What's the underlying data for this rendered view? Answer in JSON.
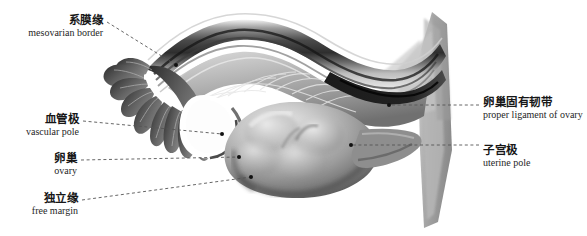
{
  "figure": {
    "width": 587,
    "height": 236,
    "background_color": "#ffffff",
    "style": "grayscale medical illustration"
  },
  "colors": {
    "label_text": "#171717",
    "english_text": "#262626",
    "leader_line": "#555555",
    "marker_dot": "#111111",
    "tissue_dark": "#3a3a3a",
    "tissue_mid": "#8a8a8a",
    "tissue_light": "#d2d2d2",
    "ovary_body": "#9a9a9a",
    "uterine_horn": "#a8a8a8"
  },
  "labels": [
    {
      "id": "mesovarian-border",
      "cn": "系膜缘",
      "en": "mesovarian border",
      "side": "left",
      "text_x": 103,
      "text_y": 14,
      "line_start_x": 107,
      "line_start_y": 22,
      "point_x": 176,
      "point_y": 65
    },
    {
      "id": "vascular-pole",
      "cn": "血管极",
      "en": "vascular pole",
      "side": "left",
      "text_x": 79,
      "text_y": 113,
      "line_start_x": 83,
      "line_start_y": 121,
      "point_x": 222,
      "point_y": 134
    },
    {
      "id": "ovary",
      "cn": "卵巢",
      "en": "ovary",
      "side": "left",
      "text_x": 77,
      "text_y": 152,
      "line_start_x": 81,
      "line_start_y": 160,
      "point_x": 239,
      "point_y": 157
    },
    {
      "id": "free-margin",
      "cn": "独立缘",
      "en": "free margin",
      "side": "left",
      "text_x": 78,
      "text_y": 192,
      "line_start_x": 82,
      "line_start_y": 200,
      "point_x": 251,
      "point_y": 177
    },
    {
      "id": "proper-ligament-of-ovary",
      "cn": "卵巢固有韧带",
      "en": "proper ligament of ovary",
      "side": "right",
      "text_x": 483,
      "text_y": 96,
      "line_start_x": 479,
      "line_start_y": 105,
      "point_x": 389,
      "point_y": 105
    },
    {
      "id": "uterine-pole",
      "cn": "子宫极",
      "en": "uterine pole",
      "side": "right",
      "text_x": 483,
      "text_y": 144,
      "line_start_x": 479,
      "line_start_y": 145,
      "point_x": 351,
      "point_y": 145
    }
  ]
}
